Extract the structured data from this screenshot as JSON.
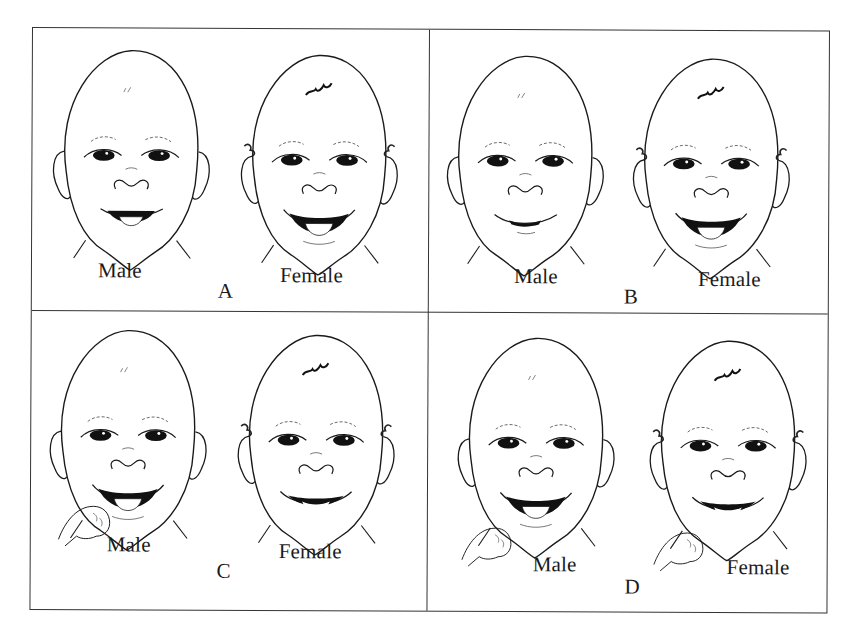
{
  "figure": {
    "panels": [
      {
        "letter": "A",
        "male_label": "Male",
        "female_label": "Female",
        "male_expression": "smile with tongue out",
        "female_expression": "open smile with tongue out",
        "hand": false
      },
      {
        "letter": "B",
        "male_label": "Male",
        "female_label": "Female",
        "male_expression": "closed smile",
        "female_expression": "open smile with tongue",
        "hand": false
      },
      {
        "letter": "C",
        "male_label": "Male",
        "female_label": "Female",
        "male_expression": "open mouth, hand to chin",
        "female_expression": "wide smile",
        "hand": "male"
      },
      {
        "letter": "D",
        "male_label": "Male",
        "female_label": "Female",
        "male_expression": "open mouth smile, fist near chin",
        "female_expression": "smile, fist near chin",
        "hand": "both"
      }
    ],
    "colors": {
      "line": "#1a1a1a",
      "background": "#ffffff",
      "border": "#333333"
    }
  }
}
